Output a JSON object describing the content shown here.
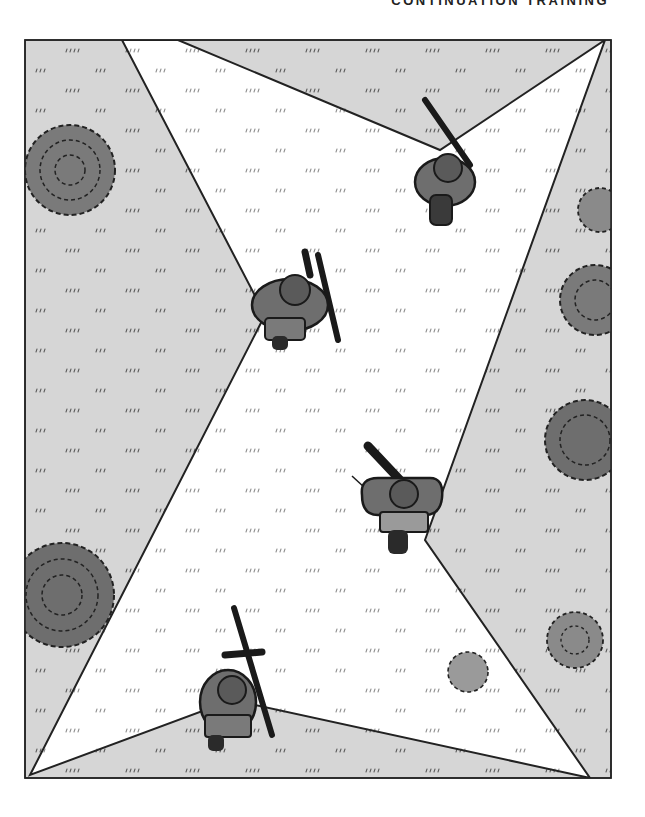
{
  "page": {
    "header": "CONTINUATION TRAINING"
  },
  "illustration": {
    "description": "Top-down view of a four-soldier fire team in wedge/diamond formation crossing an open field; white X-shaped wedges show sectors of observation, shaded gray areas outside",
    "frame": {
      "x": 25,
      "y": 40,
      "width": 586,
      "height": 738
    },
    "colors": {
      "field_shade": "#d6d6d6",
      "sector_white": "#ffffff",
      "outline": "#222222",
      "bush": "#7a7a7a",
      "soldier_uniform": "#6e6e6e",
      "soldier_dark": "#2a2a2a"
    },
    "soldiers": [
      {
        "id": "soldier-top-right",
        "x": 445,
        "y": 180,
        "weapon": "rifle"
      },
      {
        "id": "soldier-left",
        "x": 290,
        "y": 300,
        "weapon": "rifle"
      },
      {
        "id": "soldier-right",
        "x": 400,
        "y": 500,
        "weapon": "machine-gun"
      },
      {
        "id": "soldier-bottom",
        "x": 232,
        "y": 700,
        "weapon": "grenade-launcher"
      }
    ],
    "bushes": [
      {
        "x": 70,
        "y": 170,
        "r": 45
      },
      {
        "x": 600,
        "y": 210,
        "r": 22
      },
      {
        "x": 595,
        "y": 300,
        "r": 35
      },
      {
        "x": 585,
        "y": 440,
        "r": 40
      },
      {
        "x": 62,
        "y": 595,
        "r": 52
      },
      {
        "x": 575,
        "y": 640,
        "r": 28
      },
      {
        "x": 468,
        "y": 672,
        "r": 20
      }
    ]
  }
}
